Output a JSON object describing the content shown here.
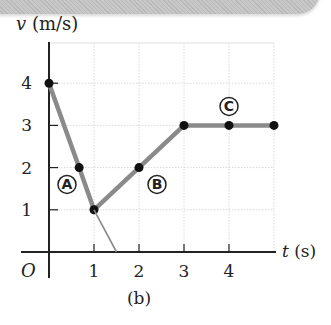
{
  "chart_data": {
    "type": "line",
    "title": "",
    "caption": "(b)",
    "xlabel": "t (s)",
    "ylabel": "v (m/s)",
    "origin_label": "O",
    "xlim": [
      0,
      5
    ],
    "ylim": [
      0,
      4.8
    ],
    "xticks": [
      1,
      2,
      3,
      4
    ],
    "yticks": [
      1,
      2,
      3,
      4
    ],
    "grid": true,
    "series": [
      {
        "name": "velocity",
        "color": "#8a8a8a",
        "points": [
          [
            0,
            4
          ],
          [
            0.67,
            2
          ],
          [
            1,
            1
          ],
          [
            2,
            2
          ],
          [
            3,
            3
          ],
          [
            4,
            3
          ],
          [
            5,
            3
          ]
        ],
        "markers": [
          [
            0,
            4
          ],
          [
            0.67,
            2
          ],
          [
            1,
            1
          ],
          [
            2,
            2
          ],
          [
            3,
            3
          ],
          [
            4,
            3
          ],
          [
            5,
            3
          ]
        ]
      },
      {
        "name": "extension",
        "color": "#8a8a8a",
        "style": "thin",
        "points": [
          [
            1,
            1
          ],
          [
            1.5,
            0
          ]
        ]
      }
    ],
    "annotations": [
      {
        "label": "A",
        "x": 0.4,
        "y": 1.6
      },
      {
        "label": "B",
        "x": 2.4,
        "y": 1.6
      },
      {
        "label": "C",
        "x": 4.0,
        "y": 3.45
      }
    ]
  }
}
